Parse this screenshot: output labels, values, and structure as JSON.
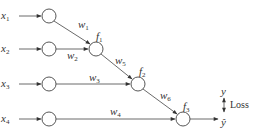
{
  "diagram": {
    "inputs": [
      {
        "id": "x1",
        "base": "x",
        "sub": "1",
        "lx": 10,
        "ly": 19,
        "nx": 49,
        "ny": 16
      },
      {
        "id": "x2",
        "base": "x",
        "sub": "2",
        "lx": 10,
        "ly": 52,
        "nx": 49,
        "ny": 49
      },
      {
        "id": "x3",
        "base": "x",
        "sub": "3",
        "lx": 10,
        "ly": 87,
        "nx": 49,
        "ny": 84
      },
      {
        "id": "x4",
        "base": "x",
        "sub": "4",
        "lx": 10,
        "ly": 122,
        "nx": 49,
        "ny": 119
      }
    ],
    "functions": [
      {
        "id": "f1",
        "base": "f",
        "sub": "1",
        "nx": 96,
        "ny": 49,
        "lx": 97,
        "ly": 37
      },
      {
        "id": "f2",
        "base": "f",
        "sub": "2",
        "nx": 138,
        "ny": 84,
        "lx": 140,
        "ly": 72
      },
      {
        "id": "f3",
        "base": "f",
        "sub": "3",
        "nx": 183,
        "ny": 119,
        "lx": 185,
        "ly": 107
      }
    ],
    "weights": [
      {
        "id": "w1",
        "base": "w",
        "sub": "1",
        "x": 79,
        "y": 26
      },
      {
        "id": "w2",
        "base": "w",
        "sub": "2",
        "x": 66,
        "y": 57
      },
      {
        "id": "w3",
        "base": "w",
        "sub": "3",
        "x": 89,
        "y": 80
      },
      {
        "id": "w4",
        "base": "w",
        "sub": "4",
        "x": 111,
        "y": 114
      },
      {
        "id": "w5",
        "base": "w",
        "sub": "5",
        "x": 116,
        "y": 62
      },
      {
        "id": "w6",
        "base": "w",
        "sub": "6",
        "x": 160,
        "y": 97
      }
    ],
    "output": {
      "y_label": "y",
      "y_hat_label": "ŷ",
      "loss_label": "Loss"
    },
    "colors": {
      "stroke": "#444444",
      "text": "#333333",
      "background": "#ffffff"
    }
  }
}
